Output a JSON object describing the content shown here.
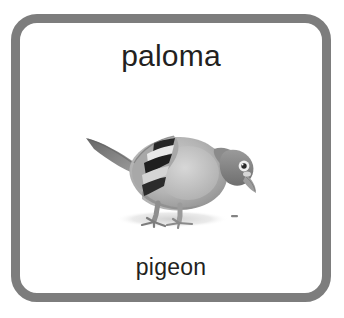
{
  "card": {
    "word_native": "paloma",
    "word_translation": "pigeon",
    "border_color": "#7d7d7d",
    "background_color": "#ffffff",
    "text_color": "#231f20"
  },
  "illustration": {
    "subject": "pigeon",
    "description": "Grayscale photograph of a pigeon standing, head lowered toward the right, tail raised to the upper left, with black barred markings on the folded wing and a soft gray shadow beneath its feet.",
    "icon_name": "pigeon-illustration",
    "colors": {
      "body_light": "#bcbcbc",
      "body_mid": "#9a9a9a",
      "body_dark": "#6e6e6e",
      "wing_bar_dark": "#2b2b2b",
      "wing_bar_light": "#e8e8e8",
      "shadow": "#dcdcdc",
      "eye_ring": "#f2f2f2",
      "eye_pupil": "#2a2a2a",
      "beak": "#8e8e8e"
    }
  }
}
